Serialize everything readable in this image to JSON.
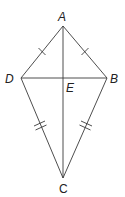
{
  "figure": {
    "type": "kite",
    "vertices": [
      {
        "label": "A",
        "x": 63,
        "y": 26
      },
      {
        "label": "B",
        "x": 107,
        "y": 78
      },
      {
        "label": "C",
        "x": 63,
        "y": 178
      },
      {
        "label": "D",
        "x": 21,
        "y": 78
      }
    ],
    "intersection": {
      "label": "E",
      "x": 63,
      "y": 78
    },
    "segments": [
      "AB",
      "BC",
      "CD",
      "DA",
      "AC",
      "DB"
    ],
    "congruence_marks": [
      {
        "segments": [
          "AD",
          "AB"
        ],
        "ticks": 1
      },
      {
        "segments": [
          "DC",
          "BC"
        ],
        "ticks": 2
      }
    ],
    "labels": {
      "A": "A",
      "B": "B",
      "C": "C",
      "D": "D",
      "E": "E"
    },
    "colors": {
      "stroke": "#3a3a3a",
      "text": "#222222"
    }
  }
}
